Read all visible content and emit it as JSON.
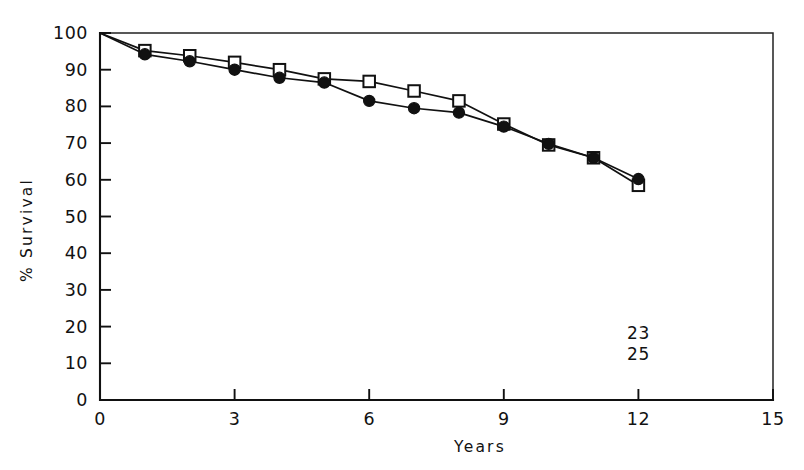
{
  "chart_data": {
    "type": "line",
    "title": "",
    "subtitle": "",
    "xlabel": "Years",
    "ylabel": "% Survival",
    "xlim": [
      0,
      15
    ],
    "ylim": [
      0,
      100
    ],
    "grid": false,
    "legend_position": "none",
    "x_ticks": [
      0,
      3,
      6,
      9,
      12,
      15
    ],
    "x_tick_labels": [
      "0",
      "3",
      "6",
      "9",
      "12",
      "15"
    ],
    "y_ticks": [
      0,
      10,
      20,
      30,
      40,
      50,
      60,
      70,
      80,
      90,
      100
    ],
    "y_tick_labels": [
      "0",
      "10",
      "20",
      "30",
      "40",
      "50",
      "60",
      "70",
      "80",
      "90",
      "100"
    ],
    "series": [
      {
        "name": "open-squares",
        "marker": "open-square",
        "x": [
          0,
          1,
          2,
          3,
          4,
          5,
          6,
          7,
          8,
          9,
          10,
          11,
          12
        ],
        "values": [
          100,
          95.2,
          93.8,
          92.0,
          90.0,
          87.5,
          86.8,
          84.2,
          81.5,
          75.2,
          69.5,
          66.0,
          58.5
        ]
      },
      {
        "name": "filled-circles",
        "marker": "filled-circle",
        "x": [
          0,
          1,
          2,
          3,
          4,
          5,
          6,
          7,
          8,
          9,
          10,
          11,
          12
        ],
        "values": [
          100,
          94.2,
          92.3,
          90.0,
          87.8,
          86.5,
          81.5,
          79.5,
          78.3,
          74.5,
          69.8,
          66.0,
          60.2
        ]
      }
    ],
    "annotations": [
      {
        "text": "23",
        "x": 12,
        "y": 16.5
      },
      {
        "text": "25",
        "x": 12,
        "y": 11.0
      }
    ]
  }
}
